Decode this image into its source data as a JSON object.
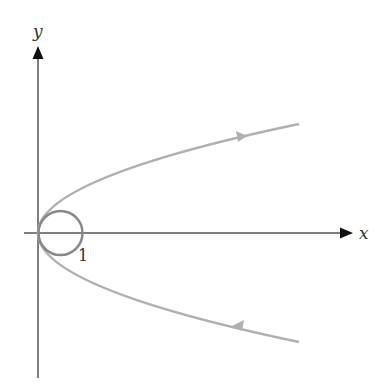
{
  "diagram": {
    "type": "phase-portrait",
    "axes": {
      "x_label": "x",
      "y_label": "y",
      "axis_color": "#555555",
      "arrow_color": "#111111"
    },
    "tick_labels": [
      {
        "text": "1",
        "position": "x-axis at x=1"
      }
    ],
    "curves": [
      {
        "name": "parabola",
        "description": "sideways parabola opening right, vertex at origin, tangent to circle",
        "color": "#b0b0b0",
        "direction_arrows": [
          "upper branch pointing right/out",
          "lower branch pointing left/in"
        ]
      },
      {
        "name": "circle",
        "description": "circle of diameter 1 centered at (0.5, 0), passing through origin",
        "color": "#888888"
      }
    ],
    "colors": {
      "background": "#ffffff",
      "parabola": "#b0b0b0",
      "circle": "#888888",
      "axes": "#555555"
    }
  }
}
